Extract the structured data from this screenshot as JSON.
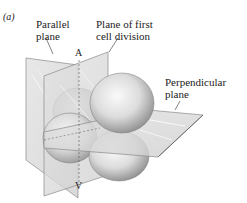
{
  "figure": {
    "panel_label": "(a)",
    "labels": {
      "parallel_plane": [
        "Parallel",
        "plane"
      ],
      "first_division_plane": [
        "Plane of first",
        "cell division"
      ],
      "perpendicular_plane": [
        "Perpendicular",
        "plane"
      ],
      "animal_pole": "A",
      "vegetal_pole": "V"
    },
    "colors": {
      "plane_fill": "#d9d9d9",
      "plane_edge": "#8a8a8a",
      "sphere_light": "#f4f4f4",
      "sphere_dark": "#9a9a9a",
      "text": "#222222"
    }
  }
}
